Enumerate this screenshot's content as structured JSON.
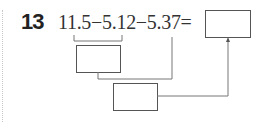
{
  "problem": {
    "number": "13",
    "expression": "11.5−5.12−5.37=",
    "terms": [
      "11.5",
      "5.12",
      "5.37"
    ],
    "operators": [
      "−",
      "−",
      "="
    ]
  },
  "diagram": {
    "boxes": [
      {
        "id": "answer-box",
        "value": ""
      },
      {
        "id": "step1-box",
        "value": "",
        "from": [
          "11.5",
          "5.12"
        ]
      },
      {
        "id": "step2-box",
        "value": "",
        "from": [
          "step1-box",
          "5.37"
        ]
      }
    ],
    "line_color": "#666666",
    "box_border_color": "#555555"
  }
}
